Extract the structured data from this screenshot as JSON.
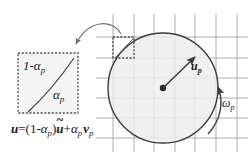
{
  "figure": {
    "width": 248,
    "height": 157,
    "background_color": "#ffffff"
  },
  "colors": {
    "stroke_dark": "#3c3c3c",
    "stroke_grid": "#9a9a9a",
    "dashed_box": "#555555",
    "circle_fill": "#ededed",
    "cell_fill": "#f0f0f0",
    "text": "#1a1a1a"
  },
  "labels": {
    "one_minus_alpha": {
      "text": "1-αp",
      "base": "1-",
      "greek": "α",
      "subscript": "p"
    },
    "alpha_inner": {
      "text": "αp",
      "greek": "α",
      "subscript": "p"
    },
    "velocity_u_p": {
      "text": "up",
      "symbol": "u",
      "subscript": "p"
    },
    "angular_omega_p": {
      "text": "ωp",
      "symbol": "ω",
      "subscript": "p"
    }
  },
  "equation": {
    "full_text": "u=(1-αp)ū+αp vp",
    "parts": {
      "lhs": "u",
      "equals": "=",
      "open_paren": "(",
      "one": "1",
      "minus": "-",
      "alpha": "α",
      "sub_p": "p",
      "close_paren": ")",
      "u_tilde": "u",
      "tilde_mark": "~",
      "plus": "+",
      "v": "v"
    }
  },
  "grid": {
    "vertical_lines_x": [
      113,
      134,
      154,
      175,
      195,
      216,
      237
    ],
    "horizontal_lines_y": [
      37,
      58,
      78,
      98,
      118,
      138
    ],
    "line_color": "#9a9a9a",
    "line_width": 0.8
  },
  "circle": {
    "center_x": 163,
    "center_y": 88,
    "radius": 55,
    "fill": "#ededed",
    "stroke": "#3c3c3c",
    "stroke_width": 1.4,
    "center_dot_radius": 3.2
  },
  "highlight_cell": {
    "x": 113,
    "y": 37,
    "width": 21,
    "height": 21,
    "style": "dashed"
  },
  "magnified_box": {
    "x": 18,
    "y": 53,
    "width": 60,
    "height": 60,
    "style": "dashed",
    "fill": "#f0f0f0"
  },
  "callout_arrow": {
    "from_x": 120,
    "from_y": 33,
    "to_x": 73,
    "to_y": 49,
    "description": "curved magnification callout arrow"
  },
  "velocity_arrow": {
    "from_x": 163,
    "from_y": 88,
    "to_x": 196,
    "to_y": 56
  },
  "rotation_arrow": {
    "description": "counterclockwise arc arrow at right of circle",
    "arrow_tip_x": 218,
    "arrow_tip_y": 84
  }
}
